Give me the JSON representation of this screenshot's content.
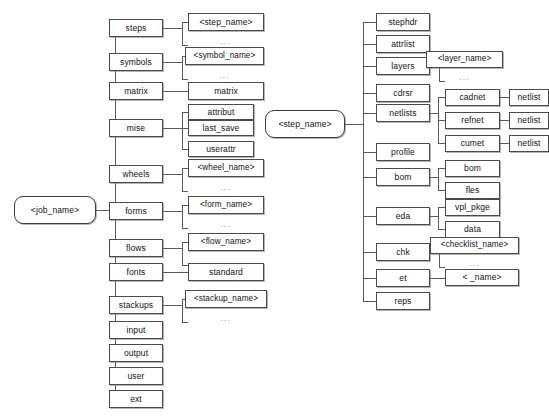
{
  "diagram": {
    "type": "tree",
    "colors": {
      "box_border": "#4a4a4a",
      "line": "#5a5a5a",
      "background": "#ffffff",
      "text": "#111111",
      "ellipsis": "#777777"
    },
    "ellipsis_label": "..."
  },
  "job_tree": {
    "root": "<job_name>",
    "children": [
      {
        "label": "steps",
        "child": "<step_name>",
        "repeated": true
      },
      {
        "label": "symbols",
        "child": "<symbol_name>",
        "repeated": true
      },
      {
        "label": "matrix",
        "child": "matrix",
        "repeated": false
      },
      {
        "label": "mise",
        "children": [
          "attribut",
          "last_save",
          "userattr"
        ]
      },
      {
        "label": "wheels",
        "child": "<wheel_name>",
        "repeated": true
      },
      {
        "label": "forms",
        "child": "<form_name>",
        "repeated": true
      },
      {
        "label": "flows",
        "child": "<flow_name>",
        "repeated": true
      },
      {
        "label": "fonts",
        "child": "standard",
        "repeated": false
      },
      {
        "label": "stackups",
        "child": "<stackup_name>",
        "repeated": true
      },
      {
        "label": "input",
        "child": null
      },
      {
        "label": "output",
        "child": null
      },
      {
        "label": "user",
        "child": null
      },
      {
        "label": "ext",
        "child": null
      }
    ]
  },
  "step_tree": {
    "root": "<step_name>",
    "children": [
      {
        "label": "stephdr"
      },
      {
        "label": "attrlist"
      },
      {
        "label": "layers",
        "child": "<layer_name>",
        "repeated": true
      },
      {
        "label": "cdrsr"
      },
      {
        "label": "netlists",
        "grandchildren": [
          {
            "label": "cadnet",
            "child": "netlist"
          },
          {
            "label": "refnet",
            "child": "netlist"
          },
          {
            "label": "cumet",
            "child": "netlist"
          }
        ]
      },
      {
        "label": "profile"
      },
      {
        "label": "bom",
        "children": [
          "bom",
          "fles"
        ]
      },
      {
        "label": "eda",
        "children": [
          "vpl_pkge",
          "data"
        ]
      },
      {
        "label": "chk",
        "child": "<checklist_name>",
        "repeated": true
      },
      {
        "label": "et",
        "child": "<    _name>"
      },
      {
        "label": "reps"
      }
    ]
  }
}
